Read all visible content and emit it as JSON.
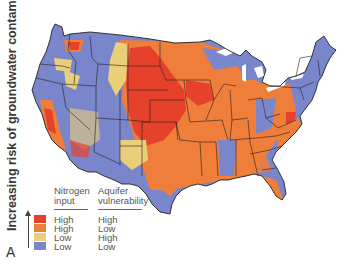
{
  "figure": {
    "y_axis_label": "Increasing risk of groundwater contamination",
    "panel_letter": "A"
  },
  "legend": {
    "headers": {
      "col1": "Nitrogen\ninput",
      "col1_line1": "Nitrogen",
      "col1_line2": "input",
      "col2_line1": "Aquifer",
      "col2_line2": "vulnerability"
    },
    "items": [
      {
        "nitrogen_input": "High",
        "aquifer_vulnerability": "High",
        "color": "#e5412b"
      },
      {
        "nitrogen_input": "High",
        "aquifer_vulnerability": "Low",
        "color": "#ef7e3a"
      },
      {
        "nitrogen_input": "Low",
        "aquifer_vulnerability": "High",
        "color": "#e9cf7a"
      },
      {
        "nitrogen_input": "Low",
        "aquifer_vulnerability": "Low",
        "color": "#7a86cc"
      }
    ]
  },
  "map": {
    "region": "Contiguous United States",
    "colors": {
      "high_high": "#e5412b",
      "high_low": "#ef7e3a",
      "low_high": "#e9cf7a",
      "low_low": "#7a86cc",
      "border": "#222222"
    }
  }
}
